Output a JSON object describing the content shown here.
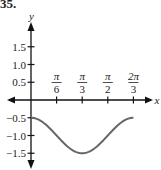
{
  "problem_number": "35.",
  "chart_data": {
    "type": "line",
    "title": "",
    "xlabel": "x",
    "ylabel": "y",
    "function": "y = -1 + 0.5cos(3x)",
    "x_range": [
      0,
      2.0944
    ],
    "ylim": [
      -1.75,
      2.0
    ],
    "x_ticks": [
      {
        "value": 0.5236,
        "num": "π",
        "den": "6"
      },
      {
        "value": 1.0472,
        "num": "π",
        "den": "3"
      },
      {
        "value": 1.5708,
        "num": "π",
        "den": "2"
      },
      {
        "value": 2.0944,
        "num": "2π",
        "den": "3"
      }
    ],
    "y_ticks": [
      {
        "value": 1.5,
        "label": "1.5"
      },
      {
        "value": 1.0,
        "label": "1.0"
      },
      {
        "value": 0.5,
        "label": "0.5"
      },
      {
        "value": -0.5,
        "label": "-0.5"
      },
      {
        "value": -1.0,
        "label": "-1.0"
      },
      {
        "value": -1.5,
        "label": "-1.5"
      }
    ],
    "series": [
      {
        "name": "curve",
        "x": [
          0,
          0.2618,
          0.5236,
          0.7854,
          1.0472,
          1.309,
          1.5708,
          1.8326,
          2.0944
        ],
        "values": [
          -0.5,
          -0.646,
          -1.0,
          -1.354,
          -1.5,
          -1.354,
          -1.0,
          -0.646,
          -0.5
        ]
      }
    ],
    "grid": false,
    "legend": null,
    "colors": {
      "axis": "#111111",
      "curve": "#666666",
      "text": "#222222"
    }
  }
}
